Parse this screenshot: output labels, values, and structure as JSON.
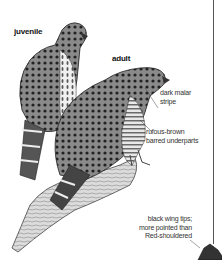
{
  "labels": {
    "juvenile": "juvenile",
    "adult": "adult",
    "malar_line1": "dark malar",
    "malar_line2": "stripe",
    "under_line1": "rufous-brown",
    "under_line2": "barred underparts",
    "wing_line1": "black wing tips;",
    "wing_line2": "more pointed than",
    "wing_line3": "Red-shouldered"
  },
  "colors": {
    "ink": "#222222",
    "background": "#ffffff",
    "rule": "#555555"
  }
}
